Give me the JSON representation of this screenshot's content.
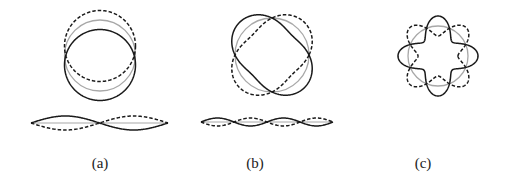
{
  "figure": {
    "type": "vibration-mode-shapes",
    "colors": {
      "deformed_solid": "#1a1a1a",
      "deformed_dashed": "#1a1a1a",
      "undeformed": "#a8a8a8"
    },
    "panels": [
      {
        "id": "a",
        "label": "(a)",
        "ring_mode": 1,
        "string_half_waves": 2
      },
      {
        "id": "b",
        "label": "(b)",
        "ring_mode": 2,
        "string_half_waves": 4
      },
      {
        "id": "c",
        "label": "(c)",
        "ring_mode": 4,
        "string_half_waves": 0
      }
    ]
  }
}
